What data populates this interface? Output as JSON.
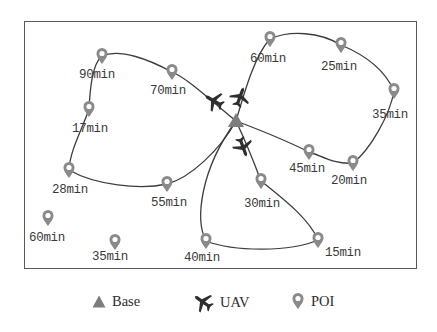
{
  "diagram": {
    "type": "uav-route-map",
    "colors": {
      "route": "#3c3c3c",
      "base": "#7d7d7d",
      "uav": "#2e2e2e",
      "poi": "#8a8a8a",
      "frame": "#5a5a5a",
      "text": "#3a3a3a"
    },
    "base": {
      "x": 236,
      "y": 121
    },
    "uavs": [
      {
        "id": "uav-1",
        "x": 214,
        "y": 101,
        "angle": -60
      },
      {
        "id": "uav-2",
        "x": 240,
        "y": 97,
        "angle": 20
      },
      {
        "id": "uav-3",
        "x": 243,
        "y": 147,
        "angle": 160
      }
    ],
    "pois": [
      {
        "id": "poi-90",
        "label": "90min",
        "x": 102,
        "y": 56,
        "lx": 79,
        "ly": 68
      },
      {
        "id": "poi-70",
        "label": "70min",
        "x": 172,
        "y": 72,
        "lx": 150,
        "ly": 84
      },
      {
        "id": "poi-17",
        "label": "17min",
        "x": 89,
        "y": 109,
        "lx": 72,
        "ly": 122
      },
      {
        "id": "poi-28",
        "label": "28min",
        "x": 69,
        "y": 170,
        "lx": 52,
        "ly": 183
      },
      {
        "id": "poi-55",
        "label": "55min",
        "x": 167,
        "y": 184,
        "lx": 151,
        "ly": 196
      },
      {
        "id": "poi-60-left",
        "label": "60min",
        "x": 48,
        "y": 218,
        "lx": 29,
        "ly": 231
      },
      {
        "id": "poi-35-bottom",
        "label": "35min",
        "x": 115,
        "y": 242,
        "lx": 92,
        "ly": 250
      },
      {
        "id": "poi-40",
        "label": "40min",
        "x": 206,
        "y": 241,
        "lx": 184,
        "ly": 251
      },
      {
        "id": "poi-15",
        "label": "15min",
        "x": 318,
        "y": 240,
        "lx": 325,
        "ly": 246
      },
      {
        "id": "poi-30",
        "label": "30min",
        "x": 261,
        "y": 181,
        "lx": 244,
        "ly": 197
      },
      {
        "id": "poi-45",
        "label": "45min",
        "x": 309,
        "y": 152,
        "lx": 289,
        "ly": 162
      },
      {
        "id": "poi-20",
        "label": "20min",
        "x": 353,
        "y": 163,
        "lx": 331,
        "ly": 174
      },
      {
        "id": "poi-35-right",
        "label": "35min",
        "x": 394,
        "y": 91,
        "lx": 372,
        "ly": 108
      },
      {
        "id": "poi-25",
        "label": "25min",
        "x": 341,
        "y": 45,
        "lx": 321,
        "ly": 60
      },
      {
        "id": "poi-60-top",
        "label": "60min",
        "x": 270,
        "y": 39,
        "lx": 250,
        "ly": 52
      }
    ],
    "routes": [
      {
        "id": "route-west",
        "path": "M236,121 C210,100 190,80 172,72 C150,60 120,48 102,56 C92,64 90,90 89,109 C82,130 70,150 69,170 C95,185 140,190 167,184 C190,178 220,150 236,121"
      },
      {
        "id": "route-northeast",
        "path": "M236,121 C245,90 255,55 270,39 C290,30 320,32 341,45 C365,55 385,70 394,91 C390,115 370,150 353,163 C335,165 320,155 309,152 C285,140 260,130 236,121"
      },
      {
        "id": "route-south",
        "path": "M236,121 C245,140 255,165 261,181 C285,200 310,220 318,240 C290,252 235,252 206,241 C195,220 200,170 236,121"
      }
    ]
  },
  "legend": {
    "items": [
      {
        "key": "base",
        "label": "Base"
      },
      {
        "key": "uav",
        "label": "UAV"
      },
      {
        "key": "poi",
        "label": "POI"
      }
    ]
  }
}
